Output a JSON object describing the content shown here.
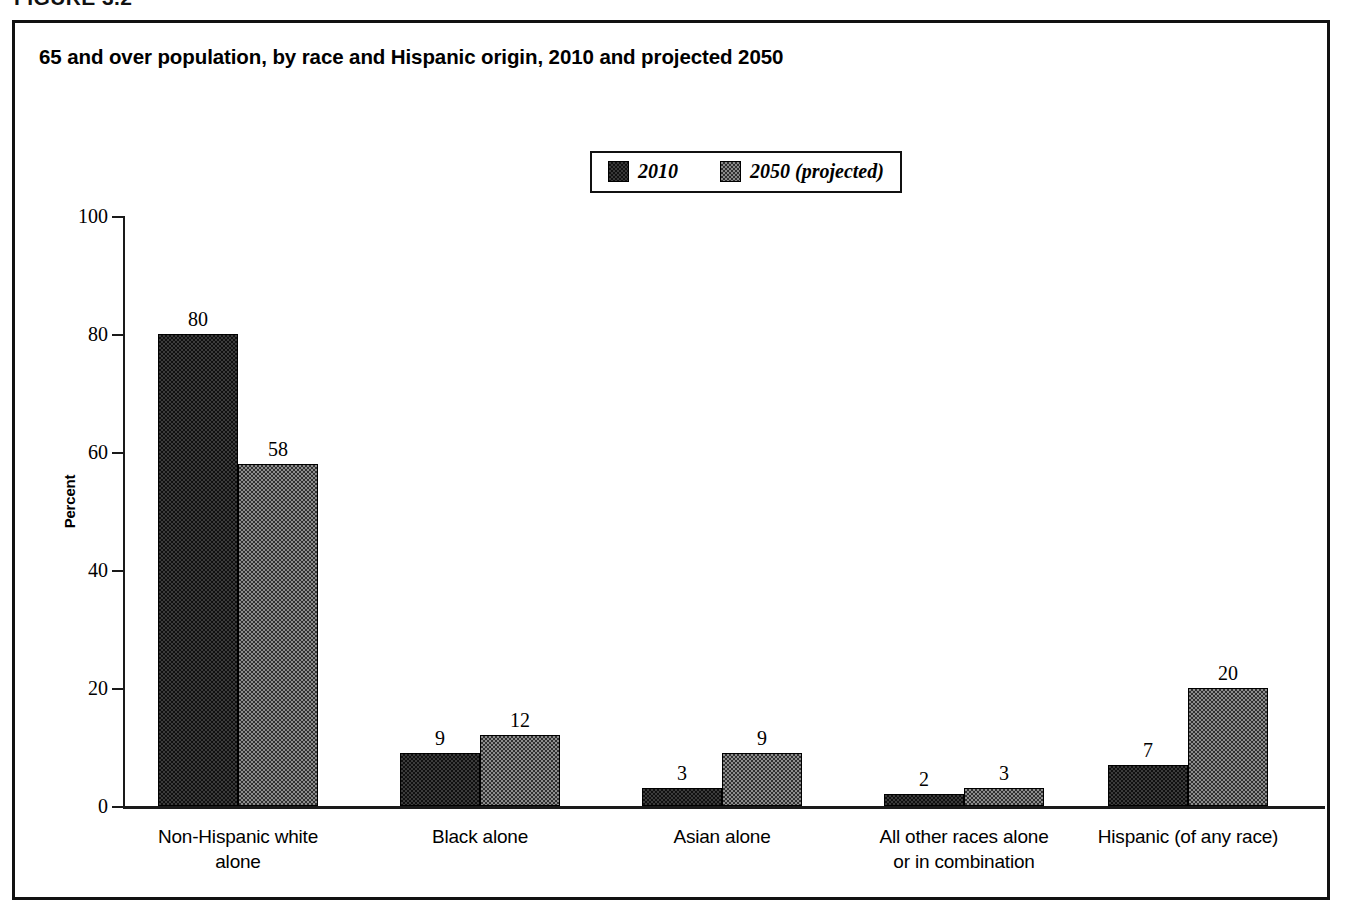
{
  "figure": {
    "label": "FIGURE 3.2"
  },
  "chart_title": "65 and over population, by race and Hispanic origin, 2010 and projected 2050",
  "legend": {
    "entries": [
      {
        "label": "2010",
        "swatch": "dark-checker-swatch",
        "color": "#3b3b3b"
      },
      {
        "label": "2050 (projected)",
        "swatch": "gray-checker-swatch",
        "color": "#8d8d8d"
      }
    ]
  },
  "axis": {
    "y_title": "Percent",
    "y_ticks": [
      "0",
      "20",
      "40",
      "60",
      "80",
      "100"
    ]
  },
  "chart_data": {
    "type": "bar",
    "title": "65 and over population, by race and Hispanic origin, 2010 and projected 2050",
    "xlabel": "",
    "ylabel": "Percent",
    "ylim": [
      0,
      100
    ],
    "yticks": [
      0,
      20,
      40,
      60,
      80,
      100
    ],
    "grid": false,
    "legend_position": "top-center",
    "categories": [
      "Non-Hispanic white alone",
      "Black alone",
      "Asian alone",
      "All other races alone or in combination",
      "Hispanic (of any race)"
    ],
    "category_lines": [
      [
        "Non-Hispanic white",
        "alone"
      ],
      [
        "Black alone"
      ],
      [
        "Asian alone"
      ],
      [
        "All other races alone",
        "or in combination"
      ],
      [
        "Hispanic (of any race)"
      ]
    ],
    "series": [
      {
        "name": "2010",
        "values": [
          80,
          9,
          3,
          2,
          7
        ]
      },
      {
        "name": "2050 (projected)",
        "values": [
          58,
          12,
          9,
          3,
          20
        ]
      }
    ]
  }
}
